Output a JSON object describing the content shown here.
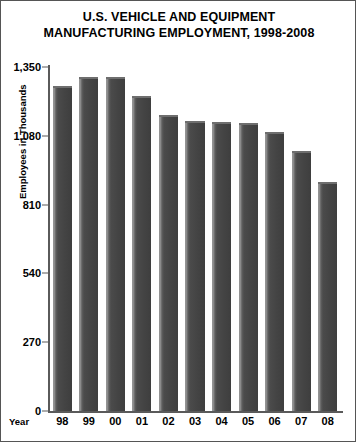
{
  "chart_data": {
    "type": "bar",
    "title": "U.S. VEHICLE AND EQUIPMENT MANUFACTURING EMPLOYMENT, 1998-2008",
    "title_lines": [
      "U.S. VEHICLE AND EQUIPMENT",
      "MANUFACTURING EMPLOYMENT, 1998-2008"
    ],
    "xlabel": "Year",
    "ylabel": "Employees in Thousands",
    "categories": [
      "98",
      "99",
      "00",
      "01",
      "02",
      "03",
      "04",
      "05",
      "06",
      "07",
      "08"
    ],
    "values": [
      1275,
      1310,
      1310,
      1235,
      1160,
      1140,
      1135,
      1130,
      1095,
      1020,
      900
    ],
    "ylim": [
      0,
      1350
    ],
    "ytick_values": [
      0,
      270,
      540,
      810,
      1080,
      1350
    ],
    "ytick_labels": [
      "0",
      "270",
      "540",
      "810",
      "1,080",
      "1,350"
    ],
    "grid": false,
    "legend": null,
    "bar_color": "#4a4a4a",
    "axis_color": "#5a5a5a",
    "text_color": "#000000",
    "background_color": "#ffffff"
  }
}
